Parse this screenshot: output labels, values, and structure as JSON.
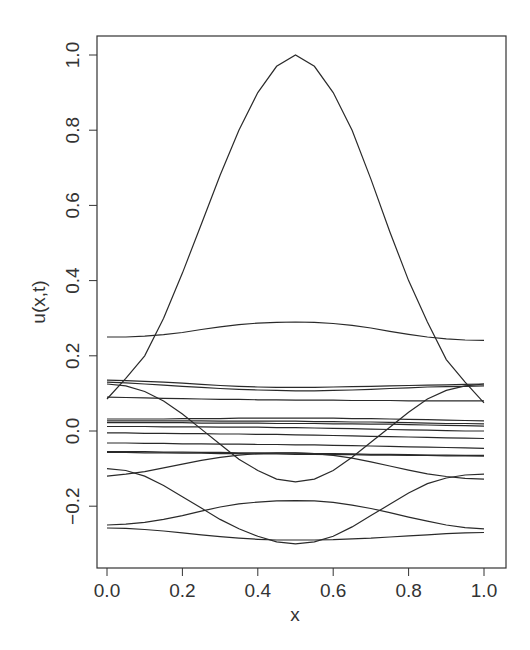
{
  "chart_data": {
    "type": "line",
    "title": "",
    "xlabel": "x",
    "ylabel": "u(x,t)",
    "xlim": [
      -0.03,
      1.04
    ],
    "ylim": [
      -0.36,
      1.05
    ],
    "x_ticks": [
      0.0,
      0.2,
      0.4,
      0.6,
      0.8,
      1.0
    ],
    "x_tick_labels": [
      "0.0",
      "0.2",
      "0.4",
      "0.6",
      "0.8",
      "1.0"
    ],
    "y_ticks": [
      -0.2,
      0.0,
      0.2,
      0.4,
      0.6,
      0.8,
      1.0
    ],
    "y_tick_labels": [
      "−0.2",
      "0.0",
      "0.2",
      "0.4",
      "0.6",
      "0.8",
      "1.0"
    ],
    "grid": false,
    "legend": null,
    "x": [
      0.0,
      0.05,
      0.1,
      0.15,
      0.2,
      0.25,
      0.3,
      0.35,
      0.4,
      0.45,
      0.5,
      0.55,
      0.6,
      0.65,
      0.7,
      0.75,
      0.8,
      0.85,
      0.9,
      0.95,
      1.0
    ],
    "series": [
      {
        "name": "t0",
        "values": [
          0.085,
          0.14,
          0.2,
          0.3,
          0.42,
          0.55,
          0.68,
          0.8,
          0.9,
          0.97,
          1.0,
          0.97,
          0.9,
          0.8,
          0.67,
          0.53,
          0.4,
          0.29,
          0.19,
          0.13,
          0.075
        ]
      },
      {
        "name": "t1",
        "values": [
          0.25,
          0.25,
          0.252,
          0.256,
          0.262,
          0.27,
          0.277,
          0.283,
          0.287,
          0.289,
          0.29,
          0.289,
          0.286,
          0.281,
          0.274,
          0.265,
          0.257,
          0.25,
          0.245,
          0.242,
          0.241
        ]
      },
      {
        "name": "t2",
        "values": [
          0.135,
          0.134,
          0.132,
          0.13,
          0.127,
          0.124,
          0.121,
          0.119,
          0.117,
          0.116,
          0.116,
          0.116,
          0.117,
          0.118,
          0.119,
          0.12,
          0.121,
          0.122,
          0.123,
          0.124,
          0.125
        ]
      },
      {
        "name": "t3",
        "values": [
          0.13,
          0.128,
          0.125,
          0.122,
          0.119,
          0.116,
          0.113,
          0.111,
          0.109,
          0.108,
          0.107,
          0.107,
          0.108,
          0.109,
          0.111,
          0.113,
          0.115,
          0.117,
          0.118,
          0.119,
          0.12
        ]
      },
      {
        "name": "t4",
        "values": [
          0.09,
          0.089,
          0.088,
          0.087,
          0.086,
          0.085,
          0.084,
          0.084,
          0.083,
          0.083,
          0.082,
          0.082,
          0.082,
          0.081,
          0.081,
          0.081,
          0.08,
          0.08,
          0.08,
          0.08,
          0.08
        ]
      },
      {
        "name": "t5",
        "values": [
          0.125,
          0.12,
          0.105,
          0.08,
          0.045,
          0.005,
          -0.035,
          -0.075,
          -0.105,
          -0.128,
          -0.135,
          -0.128,
          -0.105,
          -0.07,
          -0.03,
          0.01,
          0.05,
          0.085,
          0.108,
          0.12,
          0.125
        ]
      },
      {
        "name": "t6",
        "values": [
          0.032,
          0.032,
          0.032,
          0.032,
          0.033,
          0.033,
          0.033,
          0.034,
          0.034,
          0.034,
          0.034,
          0.034,
          0.034,
          0.033,
          0.033,
          0.032,
          0.031,
          0.03,
          0.029,
          0.028,
          0.027
        ]
      },
      {
        "name": "t7",
        "values": [
          0.027,
          0.027,
          0.027,
          0.027,
          0.027,
          0.027,
          0.026,
          0.026,
          0.026,
          0.026,
          0.026,
          0.025,
          0.025,
          0.024,
          0.024,
          0.023,
          0.022,
          0.021,
          0.02,
          0.02,
          0.019
        ]
      },
      {
        "name": "t8",
        "values": [
          0.022,
          0.022,
          0.022,
          0.022,
          0.022,
          0.021,
          0.021,
          0.021,
          0.021,
          0.02,
          0.02,
          0.02,
          0.019,
          0.019,
          0.018,
          0.018,
          0.017,
          0.016,
          0.015,
          0.014,
          0.013
        ]
      },
      {
        "name": "t9",
        "values": [
          0.012,
          0.012,
          0.012,
          0.011,
          0.011,
          0.011,
          0.01,
          0.01,
          0.01,
          0.009,
          0.009,
          0.008,
          0.007,
          0.006,
          0.005,
          0.004,
          0.003,
          0.002,
          0.001,
          0.0,
          0.0
        ]
      },
      {
        "name": "t10",
        "values": [
          -0.005,
          -0.005,
          -0.006,
          -0.006,
          -0.007,
          -0.007,
          -0.008,
          -0.008,
          -0.009,
          -0.009,
          -0.01,
          -0.011,
          -0.012,
          -0.013,
          -0.014,
          -0.015,
          -0.016,
          -0.017,
          -0.018,
          -0.019,
          -0.02
        ]
      },
      {
        "name": "t11",
        "values": [
          -0.032,
          -0.032,
          -0.033,
          -0.033,
          -0.034,
          -0.034,
          -0.035,
          -0.035,
          -0.036,
          -0.036,
          -0.037,
          -0.037,
          -0.038,
          -0.039,
          -0.04,
          -0.041,
          -0.042,
          -0.043,
          -0.044,
          -0.045,
          -0.046
        ]
      },
      {
        "name": "t12",
        "values": [
          -0.055,
          -0.055,
          -0.055,
          -0.056,
          -0.056,
          -0.057,
          -0.057,
          -0.058,
          -0.058,
          -0.059,
          -0.059,
          -0.06,
          -0.06,
          -0.061,
          -0.062,
          -0.062,
          -0.063,
          -0.064,
          -0.064,
          -0.065,
          -0.065
        ]
      },
      {
        "name": "t13",
        "values": [
          -0.057,
          -0.057,
          -0.058,
          -0.058,
          -0.059,
          -0.059,
          -0.06,
          -0.06,
          -0.061,
          -0.061,
          -0.062,
          -0.062,
          -0.063,
          -0.063,
          -0.064,
          -0.064,
          -0.065,
          -0.065,
          -0.066,
          -0.066,
          -0.067
        ]
      },
      {
        "name": "t14",
        "values": [
          -0.12,
          -0.115,
          -0.108,
          -0.098,
          -0.088,
          -0.078,
          -0.07,
          -0.064,
          -0.06,
          -0.058,
          -0.058,
          -0.06,
          -0.065,
          -0.072,
          -0.082,
          -0.093,
          -0.104,
          -0.114,
          -0.121,
          -0.126,
          -0.128
        ]
      },
      {
        "name": "t15",
        "values": [
          -0.1,
          -0.105,
          -0.12,
          -0.145,
          -0.175,
          -0.205,
          -0.235,
          -0.26,
          -0.28,
          -0.295,
          -0.3,
          -0.295,
          -0.28,
          -0.255,
          -0.225,
          -0.195,
          -0.165,
          -0.14,
          -0.125,
          -0.117,
          -0.115
        ]
      },
      {
        "name": "t16",
        "values": [
          -0.25,
          -0.248,
          -0.243,
          -0.235,
          -0.225,
          -0.213,
          -0.202,
          -0.194,
          -0.189,
          -0.186,
          -0.185,
          -0.186,
          -0.19,
          -0.197,
          -0.206,
          -0.217,
          -0.229,
          -0.24,
          -0.25,
          -0.257,
          -0.26
        ]
      },
      {
        "name": "t17",
        "values": [
          -0.258,
          -0.259,
          -0.262,
          -0.266,
          -0.271,
          -0.276,
          -0.281,
          -0.285,
          -0.288,
          -0.29,
          -0.29,
          -0.29,
          -0.289,
          -0.287,
          -0.285,
          -0.282,
          -0.279,
          -0.276,
          -0.273,
          -0.271,
          -0.27
        ]
      }
    ]
  },
  "axes": {
    "x_label": "x",
    "y_label": "u(x,t)"
  }
}
